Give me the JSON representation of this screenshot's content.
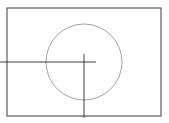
{
  "diagram": {
    "canvas": {
      "width": 169,
      "height": 123,
      "background": "#ffffff"
    },
    "frame": {
      "x": 7,
      "y": 8,
      "width": 154,
      "height": 108,
      "stroke": "#3a3a3a"
    },
    "circle": {
      "cx": 84,
      "cy": 62,
      "r": 38,
      "stroke": "#8a8a8a"
    },
    "horizontal_line": {
      "x1": 0,
      "y1": 62,
      "x2": 96,
      "y2": 62,
      "stroke": "#2a2a2a"
    },
    "vertical_line": {
      "x1": 84,
      "y1": 54,
      "x2": 84,
      "y2": 118,
      "stroke": "#2a2a2a"
    },
    "caption": ""
  }
}
